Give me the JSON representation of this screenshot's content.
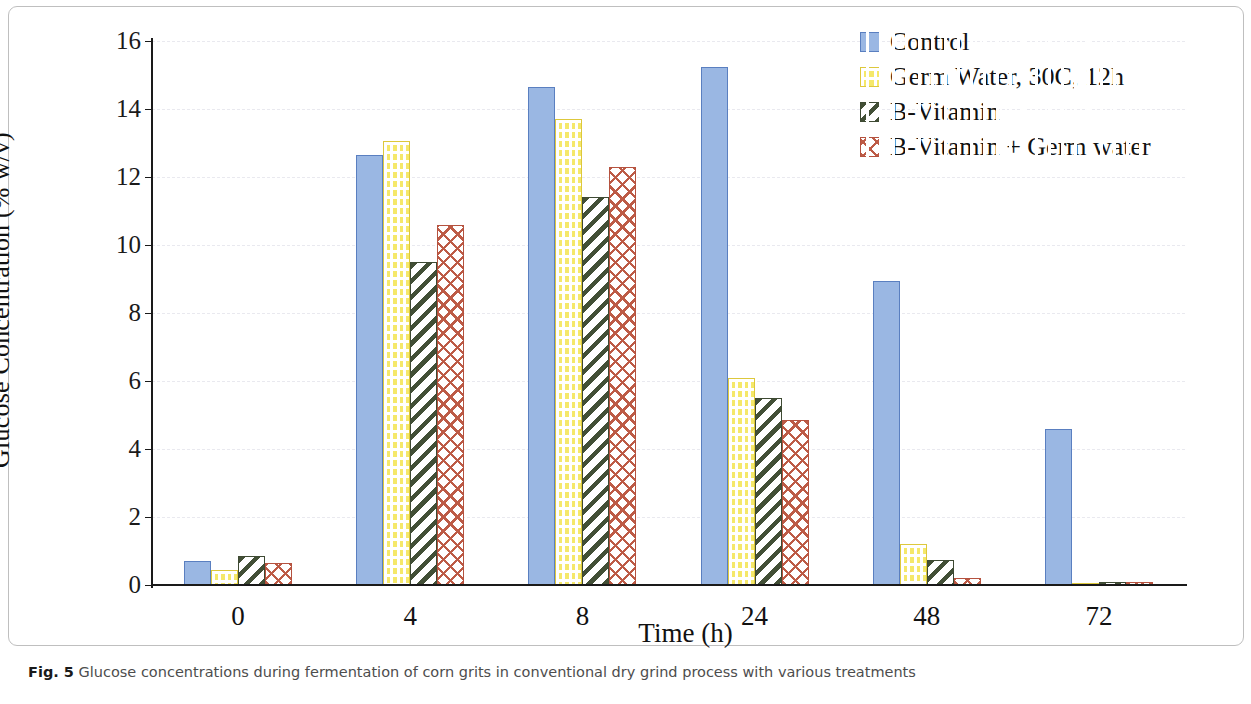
{
  "figure": {
    "caption_prefix": "Fig. 5",
    "caption_text": "Glucose concentrations during fermentation of corn grits in conventional dry grind process with various treatments"
  },
  "chart_data": {
    "type": "bar",
    "title": "",
    "xlabel": "Time (h)",
    "ylabel": "Glucose Concentration (% w/v)",
    "categories": [
      "0",
      "4",
      "8",
      "24",
      "48",
      "72"
    ],
    "ylim": [
      0,
      16
    ],
    "yticks": [
      "0",
      "2",
      "4",
      "6",
      "8",
      "10",
      "12",
      "14",
      "16"
    ],
    "grid": true,
    "legend_position": "top-right",
    "series": [
      {
        "name": "Control",
        "color": "#9ab7e3",
        "border": "#5a7fc0",
        "pattern": "solid",
        "values": [
          0.7,
          12.65,
          14.65,
          15.25,
          8.95,
          4.6
        ]
      },
      {
        "name": "Germ Water, 30C, 12h",
        "color": "#f5e86a",
        "border": "#ddc83c",
        "pattern": "brick",
        "values": [
          0.45,
          13.05,
          13.7,
          6.1,
          1.2,
          0.02
        ]
      },
      {
        "name": "B-Vitamin",
        "color": "#424f36",
        "border": "#3e4a33",
        "pattern": "diagonal-stripe",
        "values": [
          0.85,
          9.5,
          11.4,
          5.5,
          0.75,
          0.08
        ]
      },
      {
        "name": "B-Vitamin + Germ water",
        "color": "#bd5b46",
        "border": "#b5523f",
        "pattern": "trellis-crosshatch",
        "values": [
          0.65,
          10.6,
          12.3,
          4.85,
          0.2,
          0.08
        ]
      }
    ]
  }
}
